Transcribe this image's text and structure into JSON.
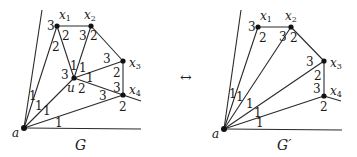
{
  "figure": {
    "arrow_symbol": "↔",
    "graphs": [
      {
        "id": "G",
        "caption": "G",
        "caption_pos": [
          75,
          150
        ],
        "nodes": [
          {
            "id": "a",
            "label": "a",
            "x": 24,
            "y": 128,
            "lx": 12,
            "ly": 137
          },
          {
            "id": "x1",
            "label": "x",
            "sub": "1",
            "x": 57,
            "y": 26,
            "lx": 59,
            "ly": 19
          },
          {
            "id": "x2",
            "label": "x",
            "sub": "2",
            "x": 91,
            "y": 26,
            "lx": 84,
            "ly": 19
          },
          {
            "id": "x3",
            "label": "x",
            "sub": "3",
            "x": 123,
            "y": 61,
            "lx": 129,
            "ly": 67
          },
          {
            "id": "x4",
            "label": "x",
            "sub": "4",
            "x": 123,
            "y": 95,
            "lx": 129,
            "ly": 94
          },
          {
            "id": "u",
            "label": "u",
            "x": 74,
            "y": 78,
            "lx": 67,
            "ly": 92
          }
        ],
        "edges": [
          [
            24,
            128,
            42,
            10
          ],
          [
            24,
            128,
            57,
            26
          ],
          [
            24,
            128,
            74,
            78
          ],
          [
            24,
            128,
            123,
            95
          ],
          [
            24,
            128,
            141,
            129
          ],
          [
            57,
            26,
            91,
            26
          ],
          [
            91,
            26,
            123,
            61
          ],
          [
            123,
            61,
            123,
            95
          ],
          [
            123,
            95,
            141,
            101
          ],
          [
            57,
            26,
            74,
            78
          ],
          [
            91,
            26,
            74,
            78
          ],
          [
            74,
            78,
            123,
            61
          ],
          [
            74,
            78,
            123,
            95
          ]
        ],
        "labels": [
          {
            "t": "3",
            "x": 47,
            "y": 30
          },
          {
            "t": "2",
            "x": 62,
            "y": 40
          },
          {
            "t": "2",
            "x": 52,
            "y": 51
          },
          {
            "t": "3",
            "x": 79,
            "y": 40
          },
          {
            "t": "2",
            "x": 90,
            "y": 40
          },
          {
            "t": "1",
            "x": 70,
            "y": 70
          },
          {
            "t": "1",
            "x": 79,
            "y": 72
          },
          {
            "t": "3",
            "x": 61,
            "y": 79
          },
          {
            "t": "1",
            "x": 86,
            "y": 82
          },
          {
            "t": "2",
            "x": 78,
            "y": 93
          },
          {
            "t": "3",
            "x": 103,
            "y": 63
          },
          {
            "t": "2",
            "x": 113,
            "y": 77
          },
          {
            "t": "3",
            "x": 113,
            "y": 92
          },
          {
            "t": "3",
            "x": 99,
            "y": 100
          },
          {
            "t": "2",
            "x": 119,
            "y": 111
          },
          {
            "t": "1",
            "x": 29,
            "y": 100
          },
          {
            "t": "1",
            "x": 35,
            "y": 110
          },
          {
            "t": "1",
            "x": 43,
            "y": 115
          },
          {
            "t": "1",
            "x": 55,
            "y": 127
          }
        ]
      },
      {
        "id": "G'",
        "caption": "G′",
        "caption_pos": [
          277,
          150
        ],
        "nodes": [
          {
            "id": "a",
            "label": "a",
            "x": 224,
            "y": 129,
            "lx": 212,
            "ly": 138
          },
          {
            "id": "x1",
            "label": "x",
            "sub": "1",
            "x": 258,
            "y": 27,
            "lx": 260,
            "ly": 20
          },
          {
            "id": "x2",
            "label": "x",
            "sub": "2",
            "x": 291,
            "y": 27,
            "lx": 285,
            "ly": 20
          },
          {
            "id": "x3",
            "label": "x",
            "sub": "3",
            "x": 324,
            "y": 61,
            "lx": 330,
            "ly": 67
          },
          {
            "id": "x4",
            "label": "x",
            "sub": "4",
            "x": 324,
            "y": 96,
            "lx": 330,
            "ly": 95
          }
        ],
        "edges": [
          [
            224,
            129,
            241,
            10
          ],
          [
            224,
            129,
            258,
            27
          ],
          [
            224,
            129,
            291,
            27
          ],
          [
            224,
            129,
            324,
            61
          ],
          [
            224,
            129,
            324,
            96
          ],
          [
            224,
            129,
            342,
            130
          ],
          [
            258,
            27,
            291,
            27
          ],
          [
            291,
            27,
            324,
            61
          ],
          [
            324,
            61,
            324,
            96
          ],
          [
            324,
            96,
            341,
            101
          ]
        ],
        "labels": [
          {
            "t": "3",
            "x": 248,
            "y": 31
          },
          {
            "t": "2",
            "x": 259,
            "y": 42
          },
          {
            "t": "3",
            "x": 279,
            "y": 41
          },
          {
            "t": "2",
            "x": 290,
            "y": 42
          },
          {
            "t": "3",
            "x": 306,
            "y": 66
          },
          {
            "t": "2",
            "x": 314,
            "y": 80
          },
          {
            "t": "3",
            "x": 313,
            "y": 93
          },
          {
            "t": "2",
            "x": 320,
            "y": 111
          },
          {
            "t": "1",
            "x": 229,
            "y": 98
          },
          {
            "t": "1",
            "x": 236,
            "y": 101
          },
          {
            "t": "1",
            "x": 246,
            "y": 108
          },
          {
            "t": "1",
            "x": 254,
            "y": 117
          },
          {
            "t": "1",
            "x": 256,
            "y": 127
          }
        ]
      }
    ]
  }
}
